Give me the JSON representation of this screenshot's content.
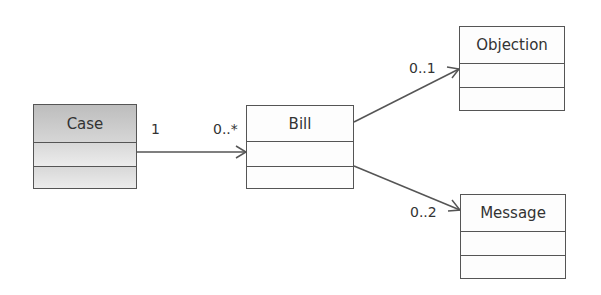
{
  "diagram": {
    "type": "UML class diagram",
    "classes": [
      {
        "id": "case",
        "name": "Case",
        "style": "gray",
        "x": 33,
        "y": 104,
        "w": 104,
        "h": 85,
        "header_h": 38,
        "comp_h": 24
      },
      {
        "id": "bill",
        "name": "Bill",
        "style": "white",
        "x": 246,
        "y": 105,
        "w": 108,
        "h": 84,
        "header_h": 36,
        "comp_h": 25
      },
      {
        "id": "objection",
        "name": "Objection",
        "style": "white",
        "x": 459,
        "y": 26,
        "w": 106,
        "h": 85,
        "header_h": 37,
        "comp_h": 24
      },
      {
        "id": "message",
        "name": "Message",
        "style": "white",
        "x": 460,
        "y": 194,
        "w": 106,
        "h": 85,
        "header_h": 37,
        "comp_h": 24
      }
    ],
    "associations": [
      {
        "from": "Case",
        "to": "Bill",
        "source_multiplicity": "1",
        "target_multiplicity": "0..*",
        "navigable": "to"
      },
      {
        "from": "Bill",
        "to": "Objection",
        "source_multiplicity": "",
        "target_multiplicity": "0..1",
        "navigable": "to"
      },
      {
        "from": "Bill",
        "to": "Message",
        "source_multiplicity": "",
        "target_multiplicity": "0..2",
        "navigable": "to"
      }
    ],
    "colors": {
      "line": "#555555",
      "text": "#333333",
      "gray_fill": "#d0d0d0",
      "white_fill": "#fdfdfd"
    }
  },
  "labels": {
    "case": "Case",
    "bill": "Bill",
    "objection": "Objection",
    "message": "Message",
    "case_bill_source": "1",
    "case_bill_target": "0..*",
    "bill_objection_target": "0..1",
    "bill_message_target": "0..2"
  }
}
